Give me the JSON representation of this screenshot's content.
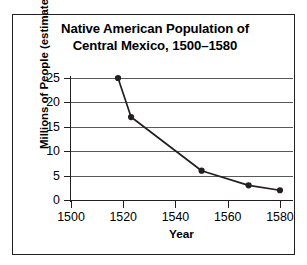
{
  "figure": {
    "title_lines": [
      "Native American Population of",
      "Central Mexico, 1500–1580"
    ],
    "border_color": "#231f20",
    "background": "#ffffff"
  },
  "chart_data": {
    "type": "line",
    "title": "Native American Population of Central Mexico, 1500–1580",
    "xlabel": "Year",
    "ylabel": "Millions of People (estimated)",
    "xlim": [
      1500,
      1585
    ],
    "ylim": [
      0,
      25
    ],
    "xticks": [
      1500,
      1520,
      1540,
      1560,
      1580
    ],
    "xtick_labels": [
      "1500",
      "1520",
      "1540",
      "1560",
      "1580"
    ],
    "yticks": [
      0,
      5,
      10,
      15,
      20,
      25
    ],
    "ytick_labels": [
      "0",
      "5",
      "10",
      "15",
      "20",
      "25"
    ],
    "grid": "horizontal",
    "legend": "none",
    "line_color": "#231f20",
    "marker": "circle",
    "marker_color": "#231f20",
    "x": [
      1518,
      1523,
      1550,
      1568,
      1580
    ],
    "values": [
      25,
      17,
      6,
      3,
      2
    ],
    "points": [
      {
        "year": 1518,
        "millions": 25
      },
      {
        "year": 1523,
        "millions": 17
      },
      {
        "year": 1550,
        "millions": 6
      },
      {
        "year": 1568,
        "millions": 3
      },
      {
        "year": 1580,
        "millions": 2
      }
    ]
  }
}
